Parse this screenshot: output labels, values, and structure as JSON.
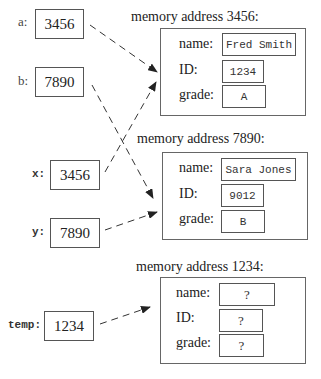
{
  "variables": [
    {
      "id": "a",
      "label": "a:",
      "value": "3456"
    },
    {
      "id": "b",
      "label": "b:",
      "value": "7890"
    },
    {
      "id": "x",
      "label": "x:",
      "value": "3456"
    },
    {
      "id": "y",
      "label": "y:",
      "value": "7890"
    },
    {
      "id": "temp",
      "label": "temp:",
      "value": "1234"
    }
  ],
  "objects": [
    {
      "title": "memory address 3456:",
      "fields": [
        {
          "label": "name:",
          "value": "Fred Smith"
        },
        {
          "label": "ID:",
          "value": "1234"
        },
        {
          "label": "grade:",
          "value": "A"
        }
      ]
    },
    {
      "title": "memory address 7890:",
      "fields": [
        {
          "label": "name:",
          "value": "Sara Jones"
        },
        {
          "label": "ID:",
          "value": "9012"
        },
        {
          "label": "grade:",
          "value": "B"
        }
      ]
    },
    {
      "title": "memory address 1234:",
      "fields": [
        {
          "label": "name:",
          "value": "?"
        },
        {
          "label": "ID:",
          "value": "?"
        },
        {
          "label": "grade:",
          "value": "?"
        }
      ]
    }
  ],
  "arrows": [
    {
      "from": "a",
      "to": "memory address 3456"
    },
    {
      "from": "b",
      "to": "memory address 7890"
    },
    {
      "from": "x",
      "to": "memory address 3456"
    },
    {
      "from": "y",
      "to": "memory address 7890"
    },
    {
      "from": "temp",
      "to": "memory address 1234"
    }
  ]
}
